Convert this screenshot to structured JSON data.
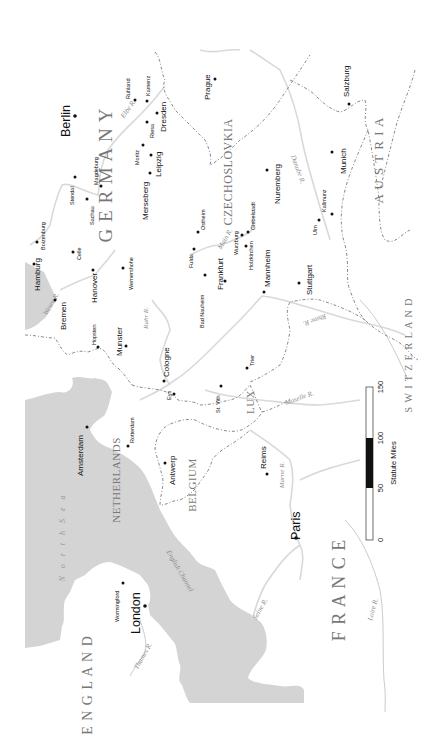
{
  "map": {
    "title": "",
    "orientation": "rotated -90deg (north points left)",
    "colors": {
      "sea": "#d4d4d4",
      "land": "#ffffff",
      "river": "#d9d9d9",
      "border": "#8a8a8a",
      "city": "#111111"
    }
  },
  "countries": [
    {
      "id": "germany",
      "label": "G E R M A N Y",
      "x": 112,
      "y": 175,
      "size": 19
    },
    {
      "id": "czechoslovakia",
      "label": "CZECHOSLOVKIA",
      "x": 232,
      "y": 172,
      "size": 12
    },
    {
      "id": "austria",
      "label": "A U S T R I A",
      "x": 383,
      "y": 160,
      "size": 13
    },
    {
      "id": "switzerland",
      "label": "S W I T Z E R L A N D",
      "x": 412,
      "y": 355,
      "size": 10
    },
    {
      "id": "netherlands",
      "label": "NETHERLANDS",
      "x": 120,
      "y": 480,
      "size": 11
    },
    {
      "id": "belgium",
      "label": "BELGIUM",
      "x": 196,
      "y": 485,
      "size": 11
    },
    {
      "id": "lux",
      "label": "LUX",
      "x": 254,
      "y": 402,
      "size": 11
    },
    {
      "id": "france",
      "label": "F R A N C E",
      "x": 345,
      "y": 590,
      "size": 18
    },
    {
      "id": "england",
      "label": "E N G L A N D",
      "x": 92,
      "y": 685,
      "size": 14
    }
  ],
  "water_labels": [
    {
      "id": "north-sea",
      "label": "N o r t h   S e a",
      "x": 65,
      "y": 537,
      "type": "sea"
    },
    {
      "id": "english-channel",
      "label": "English Channel",
      "x": 178,
      "y": 572,
      "type": "channel"
    },
    {
      "id": "elbe",
      "label": "Elbe R.",
      "x": 130,
      "y": 110,
      "type": "river"
    },
    {
      "id": "weser",
      "label": "Weser R.",
      "x": 53,
      "y": 305,
      "type": "river"
    },
    {
      "id": "ruhr",
      "label": "Ruhr R.",
      "x": 148,
      "y": 318,
      "type": "river"
    },
    {
      "id": "main",
      "label": "Main R.",
      "x": 227,
      "y": 240,
      "type": "river"
    },
    {
      "id": "danube",
      "label": "Danube R.",
      "x": 296,
      "y": 170,
      "type": "river"
    },
    {
      "id": "rhine",
      "label": "Rhine R.",
      "x": 314,
      "y": 318,
      "type": "river"
    },
    {
      "id": "moselle",
      "label": "Moselle R.",
      "x": 300,
      "y": 400,
      "type": "river"
    },
    {
      "id": "marne",
      "label": "Marne R.",
      "x": 284,
      "y": 475,
      "type": "river"
    },
    {
      "id": "seine",
      "label": "Seine R.",
      "x": 262,
      "y": 610,
      "type": "river"
    },
    {
      "id": "thames",
      "label": "Thames R.",
      "x": 145,
      "y": 657,
      "type": "river"
    },
    {
      "id": "loire",
      "label": "Loire R.",
      "x": 375,
      "y": 610,
      "type": "river"
    }
  ],
  "cities": [
    {
      "name": "Berlin",
      "x": 75,
      "y": 116,
      "lx": 70,
      "ly": 137,
      "size": "xl"
    },
    {
      "name": "Ruhland",
      "x": 135,
      "y": 100,
      "lx": 130,
      "ly": 99,
      "size": "sm"
    },
    {
      "name": "Kamenz",
      "x": 147,
      "y": 101,
      "lx": 150,
      "ly": 96,
      "size": "sm"
    },
    {
      "name": "Dresden",
      "x": 157,
      "y": 113,
      "lx": 166,
      "ly": 132,
      "size": "md"
    },
    {
      "name": "Riesa",
      "x": 147,
      "y": 122,
      "lx": 154,
      "ly": 138,
      "size": "sm"
    },
    {
      "name": "Moritz",
      "x": 143,
      "y": 145,
      "lx": 139,
      "ly": 165,
      "size": "sm"
    },
    {
      "name": "Leipzig",
      "x": 151,
      "y": 155,
      "lx": 161,
      "ly": 177,
      "size": "md"
    },
    {
      "name": "Merseberg",
      "x": 150,
      "y": 173,
      "lx": 148,
      "ly": 220,
      "size": "md"
    },
    {
      "name": "Magdeburg",
      "x": 101,
      "y": 186,
      "lx": 98,
      "ly": 185,
      "size": "sm"
    },
    {
      "name": "Stendal",
      "x": 75,
      "y": 177,
      "lx": 74,
      "ly": 205,
      "size": "sm"
    },
    {
      "name": "Sachau",
      "x": 87,
      "y": 199,
      "lx": 94,
      "ly": 225,
      "size": "sm"
    },
    {
      "name": "Boizenburg",
      "x": 37,
      "y": 242,
      "lx": 45,
      "ly": 250,
      "size": "sm"
    },
    {
      "name": "Celle",
      "x": 73,
      "y": 252,
      "lx": 81,
      "ly": 260,
      "size": "sm"
    },
    {
      "name": "Hamburg",
      "x": 34,
      "y": 264,
      "lx": 40,
      "ly": 291,
      "size": "md"
    },
    {
      "name": "Bremen",
      "x": 55,
      "y": 300,
      "lx": 66,
      "ly": 330,
      "size": "md"
    },
    {
      "name": "Hanover",
      "x": 93,
      "y": 270,
      "lx": 97,
      "ly": 303,
      "size": "md"
    },
    {
      "name": "Wernershohe",
      "x": 123,
      "y": 268,
      "lx": 133,
      "ly": 290,
      "size": "sm"
    },
    {
      "name": "Prague",
      "x": 215,
      "y": 79,
      "lx": 210,
      "ly": 100,
      "size": "md"
    },
    {
      "name": "Salzburg",
      "x": 349,
      "y": 104,
      "lx": 349,
      "ly": 97,
      "size": "md"
    },
    {
      "name": "Munich",
      "x": 332,
      "y": 152,
      "lx": 346,
      "ly": 174,
      "size": "md"
    },
    {
      "name": "Nuremberg",
      "x": 267,
      "y": 170,
      "lx": 280,
      "ly": 204,
      "size": "md"
    },
    {
      "name": "Kallmunz",
      "x": 332,
      "y": 214,
      "lx": 326,
      "ly": 212,
      "size": "sm"
    },
    {
      "name": "Ulm",
      "x": 319,
      "y": 220,
      "lx": 317,
      "ly": 235,
      "size": "sm"
    },
    {
      "name": "Ostheim",
      "x": 198,
      "y": 232,
      "lx": 205,
      "ly": 230,
      "size": "sm"
    },
    {
      "name": "Giebelstadt",
      "x": 248,
      "y": 232,
      "lx": 255,
      "ly": 230,
      "size": "sm"
    },
    {
      "name": "Wurzburg",
      "x": 242,
      "y": 235,
      "lx": 238,
      "ly": 255,
      "size": "sm"
    },
    {
      "name": "Holzkirchen",
      "x": 246,
      "y": 246,
      "lx": 253,
      "ly": 270,
      "size": "sm"
    },
    {
      "name": "Fulda",
      "x": 194,
      "y": 249,
      "lx": 193,
      "ly": 268,
      "size": "sm"
    },
    {
      "name": "Frankfurt",
      "x": 225,
      "y": 281,
      "lx": 223,
      "ly": 290,
      "size": "md"
    },
    {
      "name": "Bad Nauheim",
      "x": 205,
      "y": 275,
      "lx": 204,
      "ly": 328,
      "size": "sm"
    },
    {
      "name": "Mannheim",
      "x": 264,
      "y": 292,
      "lx": 270,
      "ly": 287,
      "size": "md"
    },
    {
      "name": "Stuttgart",
      "x": 299,
      "y": 283,
      "lx": 312,
      "ly": 295,
      "size": "md"
    },
    {
      "name": "Hopsten",
      "x": 98,
      "y": 347,
      "lx": 96,
      "ly": 345,
      "size": "sm"
    },
    {
      "name": "Munster",
      "x": 126,
      "y": 346,
      "lx": 122,
      "ly": 356,
      "size": "md"
    },
    {
      "name": "Cologne",
      "x": 164,
      "y": 381,
      "lx": 169,
      "ly": 377,
      "size": "md"
    },
    {
      "name": "Eys",
      "x": 174,
      "y": 394,
      "lx": 171,
      "ly": 400,
      "size": "sm"
    },
    {
      "name": "St. Vith",
      "x": 221,
      "y": 386,
      "lx": 220,
      "ly": 413,
      "size": "sm"
    },
    {
      "name": "Trier",
      "x": 247,
      "y": 368,
      "lx": 254,
      "ly": 366,
      "size": "sm"
    },
    {
      "name": "Rotterdam",
      "x": 128,
      "y": 446,
      "lx": 134,
      "ly": 443,
      "size": "sm"
    },
    {
      "name": "Amsterdam",
      "x": 87,
      "y": 427,
      "lx": 83,
      "ly": 476,
      "size": "md"
    },
    {
      "name": "Antwerp",
      "x": 165,
      "y": 463,
      "lx": 175,
      "ly": 485,
      "size": "md"
    },
    {
      "name": "Reims",
      "x": 267,
      "y": 474,
      "lx": 266,
      "ly": 469,
      "size": "md"
    },
    {
      "name": "Paris",
      "x": 296,
      "y": 538,
      "lx": 300,
      "ly": 540,
      "size": "xl"
    },
    {
      "name": "Wormingford",
      "x": 123,
      "y": 583,
      "lx": 119,
      "ly": 622,
      "size": "sm"
    },
    {
      "name": "London",
      "x": 145,
      "y": 606,
      "lx": 140,
      "ly": 634,
      "size": "xl"
    }
  ],
  "scale_bar": {
    "title": "Statute Miles",
    "ticks": [
      {
        "label": "0",
        "y": 540
      },
      {
        "label": "50",
        "y": 488
      },
      {
        "label": "100",
        "y": 438
      },
      {
        "label": "150",
        "y": 387
      }
    ],
    "x": 366,
    "width": 7,
    "top": 387,
    "bottom": 540,
    "black_segment": {
      "from": 50,
      "to": 100
    }
  }
}
